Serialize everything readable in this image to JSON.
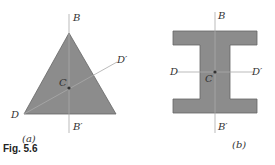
{
  "figure": {
    "caption": "Fig. 5.6",
    "panel_a": {
      "label": "(a)",
      "shape": "triangle",
      "axes": {
        "B": "B",
        "B_prime": "B′",
        "D": "D",
        "D_prime": "D′",
        "centroid": "C"
      }
    },
    "panel_b": {
      "label": "(b)",
      "shape": "I-section",
      "axes": {
        "B": "B",
        "B_prime": "B′",
        "D": "D",
        "D_prime": "D′",
        "centroid": "C"
      }
    },
    "colors": {
      "fill": "#8c8c8c",
      "line": "#999999",
      "stroke": "#555555"
    }
  }
}
